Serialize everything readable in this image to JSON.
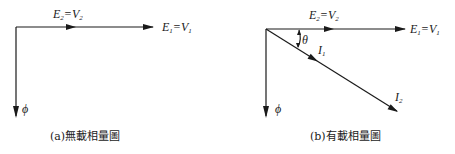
{
  "diagram_a": {
    "caption": "(a)無載相量圖",
    "labels": {
      "e2_main": "E",
      "e2_sub": "2",
      "e2_eq": "=V",
      "v2_sub": "2",
      "e1_main": "E",
      "e1_sub": "1",
      "e1_eq": "=V",
      "v1_sub": "1",
      "phi": "ϕ"
    }
  },
  "diagram_b": {
    "caption": "(b)有載相量圖",
    "labels": {
      "e2_main": "E",
      "e2_sub": "2",
      "e2_eq": "=V",
      "v2_sub": "2",
      "e1_main": "E",
      "e1_sub": "1",
      "e1_eq": "=V",
      "v1_sub": "1",
      "theta": "θ",
      "i1_main": "I",
      "i1_sub": "1",
      "i2_main": "I",
      "i2_sub": "2",
      "phi": "ϕ"
    }
  },
  "colors": {
    "ink": "#1a1a1a",
    "background": "#ffffff"
  }
}
